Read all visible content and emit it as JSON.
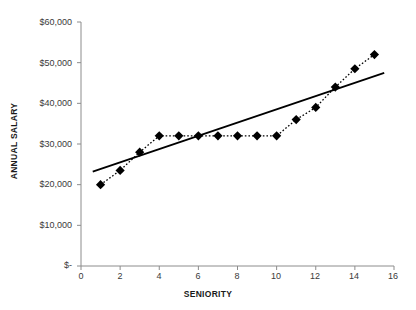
{
  "chart_data": {
    "type": "scatter",
    "title": "",
    "xlabel": "SENIORITY",
    "ylabel": "ANNUAL SALARY",
    "xlim": [
      0,
      16
    ],
    "ylim": [
      0,
      60000
    ],
    "grid": false,
    "legend": "none",
    "x": [
      1,
      2,
      3,
      4,
      5,
      6,
      7,
      8,
      9,
      10,
      11,
      12,
      13,
      14,
      15
    ],
    "values": [
      20000,
      23500,
      28000,
      32000,
      32000,
      32000,
      32000,
      32000,
      32000,
      32000,
      36000,
      39000,
      44000,
      48500,
      52000
    ],
    "series": [
      {
        "name": "Annual Salary",
        "marker": "diamond",
        "line_style": "dotted",
        "color": "#000000",
        "values": [
          20000,
          23500,
          28000,
          32000,
          32000,
          32000,
          32000,
          32000,
          32000,
          32000,
          36000,
          39000,
          44000,
          48500,
          52000
        ]
      },
      {
        "name": "Trend Line",
        "marker": "none",
        "line_style": "solid",
        "color": "#000000",
        "x_endpoints": [
          0.6,
          15.5
        ],
        "y_endpoints": [
          23200,
          47500
        ]
      }
    ],
    "x_ticks": [
      0,
      2,
      4,
      6,
      8,
      10,
      12,
      14,
      16
    ],
    "x_tick_labels": [
      "0",
      "2",
      "4",
      "6",
      "8",
      "10",
      "12",
      "14",
      "16"
    ],
    "y_ticks": [
      0,
      10000,
      20000,
      30000,
      40000,
      50000,
      60000
    ],
    "y_tick_labels": [
      "$-",
      "$10,000",
      "$20,000",
      "$30,000",
      "$40,000",
      "$50,000",
      "$60,000"
    ]
  },
  "axes": {
    "x_title": "SENIORITY",
    "y_title": "ANNUAL SALARY"
  },
  "colors": {
    "marker": "#000000",
    "trendline": "#000000",
    "axis": "#808080",
    "text": "#231f20"
  }
}
